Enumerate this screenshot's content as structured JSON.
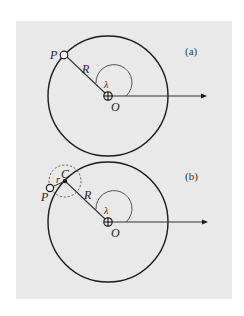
{
  "figure": {
    "panel_background": "#e9e9e9",
    "line_color": "#1a1a1a",
    "panels": [
      {
        "tag": "(a)",
        "labels": {
          "point": "P",
          "radius": "R",
          "angle": "λ",
          "origin": "O"
        }
      },
      {
        "tag": "(b)",
        "labels": {
          "point": "P",
          "center": "C",
          "small_radius": "r",
          "radius": "R",
          "angle": "λ",
          "origin": "O"
        }
      }
    ]
  }
}
